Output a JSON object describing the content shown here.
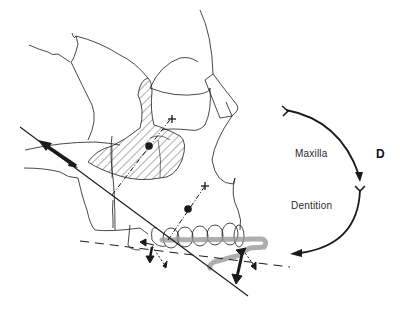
{
  "figure": {
    "panel_label": "D",
    "rotation_labels": {
      "upper": "Maxilla",
      "lower": "Dentition"
    },
    "elements": [
      "skull-outline-lateral",
      "hatched-maxilla-region",
      "dentition-row",
      "functional-occlusal-plane-dashed",
      "palatal-plane-solid-line",
      "growth-vector-arrows",
      "rotation-arc-arrows",
      "dot-dash-centroid-axes"
    ],
    "colors": {
      "line": "#1a1a1a",
      "hatch": "#333333",
      "occlusal-shadow": "#9a9a9a",
      "background": "#ffffff"
    }
  }
}
